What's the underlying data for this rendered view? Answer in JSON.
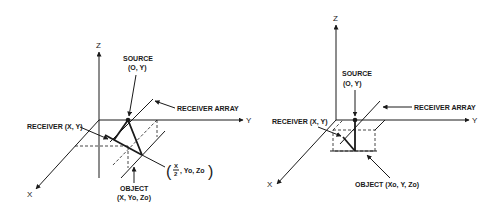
{
  "figures": [
    {
      "id": "left",
      "axes": {
        "x": "X",
        "y": "Y",
        "z": "Z"
      },
      "labels": {
        "source_title": "SOURCE",
        "source_coords": "(O, Y)",
        "receiver_array": "RECEIVER ARRAY",
        "receiver": "RECEIVER (X, Y)",
        "object_title": "OBJECT",
        "object_coords": "(X, Yo, Zo)",
        "image_point_frac_num": "X",
        "image_point_frac_den": "2",
        "image_point_rest": ", Yo, Zo"
      }
    },
    {
      "id": "right",
      "axes": {
        "x": "X",
        "y": "Y",
        "z": "Z"
      },
      "labels": {
        "source_title": "SOURCE",
        "source_coords": "(O, Y)",
        "receiver_array": "RECEIVER ARRAY",
        "receiver": "RECEIVER (X, Y)",
        "object": "OBJECT (Xo, Y, Zo)"
      }
    }
  ],
  "colors": {
    "ink": "#1a1a1a",
    "background": "#ffffff"
  }
}
